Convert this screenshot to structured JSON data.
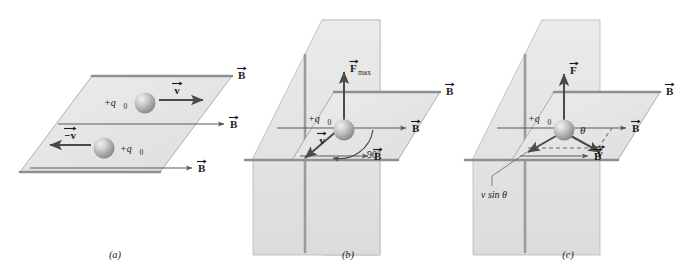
{
  "figure": {
    "background_color": "#ffffff",
    "plane_fill_horizontal": "#e9e9e9",
    "plane_fill_vertical": "#e4e4e4",
    "sphere_color": "#a9a9a9",
    "vector_color": "#4a4a4a",
    "field_line_color": "#5b5b5b"
  },
  "panels": [
    {
      "id": "a",
      "caption": "(a)",
      "description": "Charge moving parallel or antiparallel to B experiences no force",
      "charge_labels": [
        "+q0",
        "+q0"
      ],
      "velocity_labels": [
        "v",
        "-v"
      ],
      "field_labels": [
        "B",
        "B",
        "B"
      ]
    },
    {
      "id": "b",
      "caption": "(b)",
      "description": "Charge moving perpendicular to B experiences maximum force",
      "charge_label": "+q0",
      "force_label": "F",
      "force_subscript": "max",
      "velocity_label": "v",
      "angle_label": "90°",
      "field_labels": [
        "B",
        "B",
        "B"
      ]
    },
    {
      "id": "c",
      "caption": "(c)",
      "description": "Charge moving at angle theta to B; force depends on v sin theta",
      "charge_label": "+q0",
      "force_label": "F",
      "velocity_label": "v",
      "angle_label": "θ",
      "component_label": "v sin θ",
      "field_labels": [
        "B",
        "B",
        "B"
      ]
    }
  ],
  "symbols": {
    "charge": "+q",
    "charge_subscript": "0",
    "vector_b": "B",
    "vector_v": "v",
    "vector_v_neg": "−v",
    "vector_f": "F",
    "subscript_max": "max",
    "angle_90": "90°",
    "theta": "θ",
    "v_sin_theta": "v sin θ",
    "arrow_hat": "→"
  }
}
